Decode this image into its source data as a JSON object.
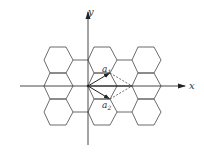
{
  "diagram": {
    "type": "honeycomb-lattice",
    "axes": {
      "x_label": "x",
      "y_label": "y"
    },
    "vectors": [
      {
        "name": "a1",
        "label_main": "a",
        "label_sub": "1"
      },
      {
        "name": "a2",
        "label_main": "a",
        "label_sub": "2"
      }
    ],
    "colors": {
      "lines": "#555555",
      "axes": "#333333",
      "vectors": "#222222",
      "dashed": "#444444",
      "background": "#ffffff"
    }
  }
}
